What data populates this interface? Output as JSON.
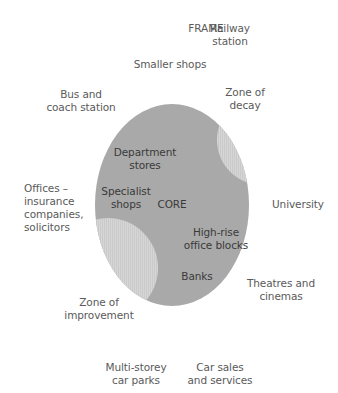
{
  "diagram": {
    "title": "FRAME",
    "core_label": "CORE",
    "colors": {
      "core_fill": "#a9a9a9",
      "zone_fill": "#d4d4d4",
      "outer_text": "#5a5a5a",
      "inner_text": "#3a3a3a",
      "background": "#ffffff"
    },
    "core_zones": {
      "department_stores": "Department\nstores",
      "specialist_shops": "Specialist\nshops",
      "high_rise": "High-rise\noffice blocks",
      "banks": "Banks"
    },
    "transition_zones": {
      "zone_of_decay": "Zone of\ndecay",
      "zone_of_improvement": "Zone of\nimprovement"
    },
    "frame_features": {
      "railway_station": "Railway\nstation",
      "smaller_shops": "Smaller shops",
      "bus_coach_station": "Bus and\ncoach station",
      "offices": "Offices –\ninsurance\ncompanies,\nsolicitors",
      "university": "University",
      "theatres": "Theatres and\ncinemas",
      "car_parks": "Multi-storey\ncar parks",
      "car_sales": "Car sales\nand services"
    }
  }
}
